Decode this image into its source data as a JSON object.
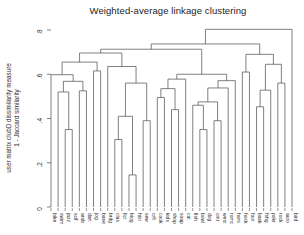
{
  "figure": {
    "title": "Weighted-average linkage clustering"
  },
  "axes": {
    "ylabel_line1": "user matrix clubD dissimilarity measure",
    "ylabel_line2": "1 - Jaccard similarity",
    "yticks": [
      {
        "v": 0.0,
        "label": "0"
      },
      {
        "v": 0.2,
        "label": ".2"
      },
      {
        "v": 0.4,
        "label": ".4"
      },
      {
        "v": 0.6,
        "label": ".6"
      },
      {
        "v": 0.8,
        "label": ".8"
      }
    ]
  },
  "chart_data": {
    "type": "dendrogram",
    "title": "Weighted-average linkage clustering",
    "ylabel": "user matrix clubD dissimilarity measure, 1 - Jaccard similarity",
    "ylim": [
      0,
      0.82
    ],
    "grid": false,
    "colors": {
      "line": "#4a4a4a",
      "text": "#303030",
      "background": "#ffffff"
    },
    "leaves": [
      "bike",
      "swim",
      "jazz",
      "scif",
      "arob",
      "dart",
      "jog",
      "base",
      "brdg",
      "clas",
      "fict",
      "biog",
      "hist",
      "sew",
      "crft",
      "cook",
      "kids",
      "shop",
      "soap",
      "cat",
      "fish",
      "bowl",
      "dog",
      "cntr",
      "west",
      "romc",
      "hors",
      "hock",
      "foot",
      "bask",
      "fshg",
      "pokr",
      "rock",
      "auto",
      "bird"
    ],
    "tree": [
      0.803,
      [
        0.737,
        [
          0.713,
          [
            0.696,
            [
              0.655,
              [
                0.598,
                "bike",
                [
                  0.568,
                  [
                    0.52,
                    "swim",
                    [
                      0.35,
                      "jazz",
                      "scif"
                    ]
                  ],
                  [
                    0.525,
                    "arob",
                    "dart"
                  ]
                ]
              ],
              [
                0.615,
                "jog",
                "base"
              ]
            ],
            [
              0.635,
              "brdg",
              [
                0.56,
                [
                  0.41,
                  [
                    0.305,
                    "clas",
                    "fict"
                  ],
                  [
                    0.145,
                    "biog",
                    "hist"
                  ]
                ],
                [
                  0.39,
                  "sew",
                  "crft"
                ]
              ]
            ]
          ],
          [
            0.6,
            [
              0.578,
              [
                0.535,
                [
                  0.495,
                  "cook",
                  "kids"
                ],
                [
                  0.44,
                  "shop",
                  "soap"
                ]
              ],
              "cat"
            ],
            [
              0.571,
              [
                0.538,
                [
                  0.475,
                  [
                    0.46,
                    "fish",
                    [
                      0.35,
                      "bowl",
                      "dog"
                    ]
                  ],
                  [
                    0.39,
                    "cntr",
                    "west"
                  ]
                ],
                "romc"
              ],
              "hors"
            ]
          ]
        ],
        [
          0.69,
          [
            0.61,
            "hock",
            "foot"
          ],
          [
            0.645,
            [
              0.528,
              [
                0.453,
                "bask",
                "fshg"
              ],
              "pokr"
            ],
            [
              0.56,
              "rock",
              "auto"
            ]
          ]
        ]
      ],
      "bird"
    ]
  }
}
